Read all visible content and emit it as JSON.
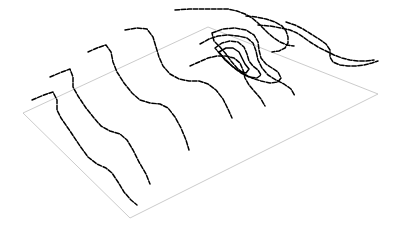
{
  "figure": {
    "title": "",
    "type": "3d-contour-terrain-plot",
    "background_color": "#ffffff",
    "line_color": "#000000",
    "base_plane_color": "#b4b4b4"
  },
  "chart_data": {
    "type": "line",
    "title": "",
    "subtitle": "",
    "xlabel": "",
    "ylabel": "",
    "grid": false,
    "legend_position": "none",
    "base_plane": {
      "name": "base-parallelogram",
      "stroke": "#b4b4b4",
      "stroke_width": 0.7,
      "corners": [
        [
          23,
          113
        ],
        [
          208,
          27
        ],
        [
          378,
          94
        ],
        [
          130,
          218
        ]
      ]
    },
    "series": [
      {
        "name": "contour-1",
        "style": "dashed",
        "points": [
          [
            32,
            100
          ],
          [
            44,
            95
          ],
          [
            53,
            92
          ],
          [
            57,
            100
          ],
          [
            57,
            110
          ],
          [
            61,
            118
          ],
          [
            70,
            131
          ],
          [
            80,
            146
          ],
          [
            88,
            157
          ],
          [
            97,
            164
          ],
          [
            106,
            168
          ],
          [
            112,
            173
          ],
          [
            118,
            182
          ],
          [
            124,
            192
          ],
          [
            131,
            200
          ],
          [
            137,
            205
          ]
        ]
      },
      {
        "name": "contour-2",
        "style": "dashed",
        "points": [
          [
            50,
            77
          ],
          [
            62,
            72
          ],
          [
            70,
            69
          ],
          [
            73,
            77
          ],
          [
            73,
            87
          ],
          [
            78,
            96
          ],
          [
            86,
            108
          ],
          [
            94,
            118
          ],
          [
            101,
            126
          ],
          [
            110,
            131
          ],
          [
            120,
            134
          ],
          [
            127,
            140
          ],
          [
            133,
            150
          ],
          [
            139,
            162
          ],
          [
            146,
            174
          ],
          [
            150,
            184
          ]
        ]
      },
      {
        "name": "contour-3",
        "style": "dashed",
        "points": [
          [
            88,
            52
          ],
          [
            97,
            48
          ],
          [
            106,
            45
          ],
          [
            111,
            52
          ],
          [
            113,
            62
          ],
          [
            117,
            72
          ],
          [
            124,
            83
          ],
          [
            132,
            93
          ],
          [
            140,
            100
          ],
          [
            150,
            103
          ],
          [
            160,
            104
          ],
          [
            168,
            108
          ],
          [
            175,
            117
          ],
          [
            181,
            128
          ],
          [
            186,
            140
          ],
          [
            189,
            150
          ]
        ]
      },
      {
        "name": "contour-4",
        "style": "dashed",
        "points": [
          [
            125,
            30
          ],
          [
            137,
            28
          ],
          [
            147,
            29
          ],
          [
            153,
            37
          ],
          [
            156,
            47
          ],
          [
            159,
            57
          ],
          [
            163,
            66
          ],
          [
            170,
            74
          ],
          [
            179,
            79
          ],
          [
            189,
            81
          ],
          [
            199,
            81
          ],
          [
            208,
            84
          ],
          [
            216,
            90
          ],
          [
            223,
            99
          ],
          [
            228,
            109
          ],
          [
            232,
            118
          ]
        ]
      },
      {
        "name": "contour-5",
        "style": "dashed",
        "points": [
          [
            175,
            10
          ],
          [
            189,
            9
          ],
          [
            203,
            9
          ],
          [
            216,
            9
          ],
          [
            228,
            9
          ],
          [
            237,
            11
          ],
          [
            245,
            14
          ],
          [
            252,
            18
          ],
          [
            258,
            23
          ],
          [
            263,
            28
          ],
          [
            268,
            33
          ],
          [
            274,
            38
          ],
          [
            280,
            42
          ],
          [
            287,
            45
          ],
          [
            294,
            46
          ]
        ]
      },
      {
        "name": "contour-6",
        "style": "dashed",
        "points": [
          [
            200,
            44
          ],
          [
            209,
            39
          ],
          [
            218,
            36
          ],
          [
            228,
            35
          ],
          [
            238,
            36
          ],
          [
            247,
            38
          ],
          [
            253,
            43
          ],
          [
            256,
            51
          ],
          [
            258,
            60
          ],
          [
            262,
            68
          ],
          [
            268,
            75
          ],
          [
            276,
            80
          ],
          [
            284,
            84
          ],
          [
            291,
            89
          ],
          [
            295,
            96
          ]
        ]
      },
      {
        "name": "contour-7",
        "style": "dashed",
        "points": [
          [
            190,
            66
          ],
          [
            199,
            62
          ],
          [
            208,
            58
          ],
          [
            217,
            56
          ],
          [
            226,
            56
          ],
          [
            234,
            58
          ],
          [
            240,
            63
          ],
          [
            243,
            70
          ],
          [
            245,
            78
          ],
          [
            249,
            85
          ],
          [
            255,
            92
          ],
          [
            261,
            99
          ],
          [
            265,
            106
          ]
        ]
      },
      {
        "name": "contour-8-loop",
        "style": "dashed",
        "closed": true,
        "points": [
          [
            212,
            33
          ],
          [
            223,
            29
          ],
          [
            235,
            28
          ],
          [
            246,
            30
          ],
          [
            254,
            35
          ],
          [
            258,
            42
          ],
          [
            259,
            50
          ],
          [
            261,
            58
          ],
          [
            266,
            64
          ],
          [
            272,
            68
          ],
          [
            278,
            72
          ],
          [
            281,
            78
          ],
          [
            278,
            82
          ],
          [
            270,
            83
          ],
          [
            261,
            81
          ],
          [
            252,
            78
          ],
          [
            244,
            74
          ],
          [
            237,
            68
          ],
          [
            231,
            61
          ],
          [
            226,
            54
          ],
          [
            220,
            47
          ],
          [
            214,
            41
          ]
        ]
      },
      {
        "name": "contour-9-loop",
        "style": "dashed",
        "closed": true,
        "points": [
          [
            215,
            48
          ],
          [
            222,
            43
          ],
          [
            230,
            41
          ],
          [
            238,
            42
          ],
          [
            244,
            47
          ],
          [
            247,
            54
          ],
          [
            249,
            61
          ],
          [
            253,
            66
          ],
          [
            258,
            70
          ],
          [
            261,
            75
          ],
          [
            257,
            78
          ],
          [
            249,
            77
          ],
          [
            241,
            73
          ],
          [
            233,
            67
          ],
          [
            226,
            60
          ],
          [
            220,
            54
          ]
        ]
      },
      {
        "name": "contour-10-inner",
        "style": "solid",
        "closed": true,
        "points": [
          [
            219,
            52
          ],
          [
            226,
            48
          ],
          [
            233,
            48
          ],
          [
            239,
            52
          ],
          [
            242,
            58
          ],
          [
            245,
            64
          ],
          [
            249,
            69
          ],
          [
            246,
            73
          ],
          [
            239,
            71
          ],
          [
            232,
            66
          ],
          [
            225,
            60
          ]
        ]
      },
      {
        "name": "contour-11-right",
        "style": "dashed",
        "points": [
          [
            258,
            25
          ],
          [
            270,
            26
          ],
          [
            281,
            28
          ],
          [
            290,
            30
          ],
          [
            297,
            33
          ],
          [
            303,
            37
          ],
          [
            310,
            42
          ],
          [
            318,
            47
          ],
          [
            326,
            51
          ],
          [
            334,
            55
          ],
          [
            342,
            58
          ],
          [
            350,
            60
          ],
          [
            358,
            61
          ],
          [
            366,
            61
          ],
          [
            374,
            60
          ]
        ]
      },
      {
        "name": "contour-12-right",
        "style": "dashed",
        "points": [
          [
            286,
            22
          ],
          [
            295,
            25
          ],
          [
            303,
            29
          ],
          [
            311,
            34
          ],
          [
            319,
            39
          ],
          [
            326,
            44
          ],
          [
            330,
            50
          ],
          [
            330,
            57
          ],
          [
            333,
            62
          ],
          [
            340,
            65
          ],
          [
            348,
            66
          ],
          [
            356,
            66
          ],
          [
            364,
            65
          ],
          [
            372,
            63
          ],
          [
            378,
            61
          ]
        ]
      },
      {
        "name": "contour-13-ridge",
        "style": "dashed",
        "points": [
          [
            246,
            16
          ],
          [
            256,
            17
          ],
          [
            266,
            19
          ],
          [
            275,
            22
          ],
          [
            282,
            26
          ],
          [
            286,
            31
          ],
          [
            288,
            37
          ],
          [
            288,
            43
          ],
          [
            285,
            48
          ],
          [
            279,
            51
          ],
          [
            272,
            52
          ]
        ]
      }
    ]
  }
}
